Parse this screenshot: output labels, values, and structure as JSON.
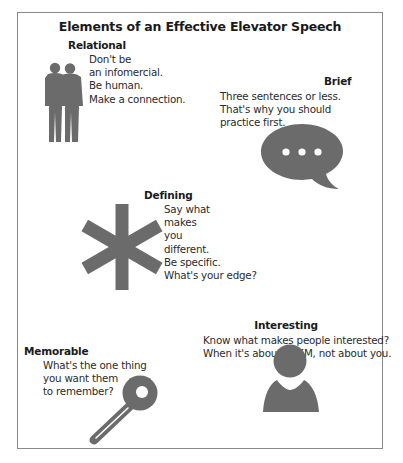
{
  "title": "Elements of an Effective Elevator Speech",
  "colors": {
    "icon_gray": "#6b6b6b",
    "frame_border": "#8a8a8a",
    "text": "#2a2a2a"
  },
  "elements": [
    {
      "heading": "Relational",
      "icon": "two-people-icon",
      "lines": [
        "Don't be",
        "an infomercial.",
        "Be human.",
        "Make a connection."
      ]
    },
    {
      "heading": "Brief",
      "icon": "speech-bubble-icon",
      "lines": [
        "Three sentences or less.",
        "That's why you should",
        "practice first."
      ]
    },
    {
      "heading": "Defining",
      "icon": "asterisk-icon",
      "lines": [
        "Say what",
        "makes",
        "you",
        "different.",
        "Be specific.",
        "What's your edge?"
      ]
    },
    {
      "heading": "Interesting",
      "icon": "person-icon",
      "lines": [
        "Know what makes people interested?",
        "When it's about THEM, not about you."
      ]
    },
    {
      "heading": "Memorable",
      "icon": "key-icon",
      "lines": [
        "What's the one thing",
        "you want them",
        "to remember?"
      ]
    }
  ]
}
